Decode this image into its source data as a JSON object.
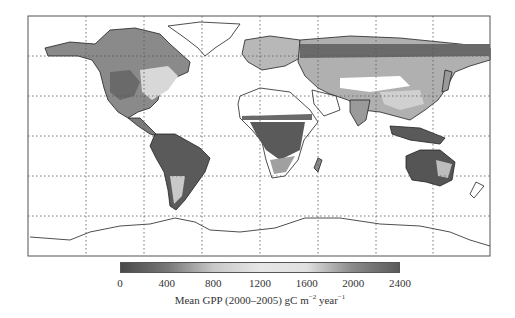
{
  "chart_data": {
    "type": "heatmap",
    "title": "",
    "subtitle": "",
    "xlabel": "",
    "ylabel": "",
    "grid": true,
    "grid_style": "dotted",
    "colorbar": {
      "label_main": "Mean GPP (2000–2005) gC m",
      "label_exp1": "−2",
      "label_mid": " year",
      "label_exp2": "−1",
      "range": [
        0,
        2400
      ],
      "ticks": [
        0,
        400,
        800,
        1200,
        1600,
        2000,
        2400
      ],
      "tick_labels": [
        "0",
        "400",
        "800",
        "1200",
        "1600",
        "2000",
        "2400"
      ],
      "orientation": "horizontal",
      "position": "bottom",
      "colormap_stops": [
        {
          "value": 0,
          "color": "#4a4a4a"
        },
        {
          "value": 400,
          "color": "#777777"
        },
        {
          "value": 800,
          "color": "#c8c8c8"
        },
        {
          "value": 1200,
          "color": "#e6e6e6"
        },
        {
          "value": 1600,
          "color": "#e0e0e0"
        },
        {
          "value": 2000,
          "color": "#8a8a8a"
        },
        {
          "value": 2400,
          "color": "#5a5a5a"
        }
      ]
    },
    "regions_approx_gpp": [
      {
        "region": "Amazon basin",
        "value_range": [
          2000,
          2400
        ]
      },
      {
        "region": "Central Africa",
        "value_range": [
          1800,
          2400
        ]
      },
      {
        "region": "Southeast Asia / Indonesia",
        "value_range": [
          2000,
          2400
        ]
      },
      {
        "region": "Eastern United States",
        "value_range": [
          1000,
          1600
        ]
      },
      {
        "region": "Europe",
        "value_range": [
          800,
          1400
        ]
      },
      {
        "region": "Boreal forests (Siberia/Canada)",
        "value_range": [
          200,
          600
        ]
      },
      {
        "region": "Sahara / Arabian deserts",
        "value_range": [
          0,
          100
        ]
      },
      {
        "region": "Australian interior",
        "value_range": [
          100,
          400
        ]
      },
      {
        "region": "Western US interior",
        "value_range": [
          200,
          500
        ]
      },
      {
        "region": "Greenland / Antarctica",
        "value_range": [
          0,
          0
        ]
      }
    ]
  }
}
